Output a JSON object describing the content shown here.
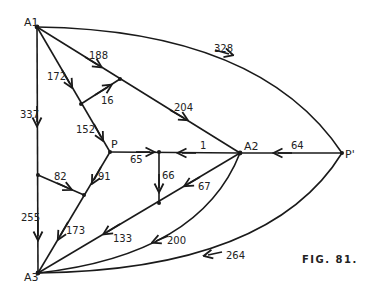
{
  "figure": {
    "caption": "FIG. 81.",
    "nodes": {
      "A1": {
        "label": "A1",
        "x": 37,
        "y": 27
      },
      "A2": {
        "label": "A2",
        "x": 240,
        "y": 153
      },
      "A3": {
        "label": "A3",
        "x": 38,
        "y": 273
      },
      "P": {
        "label": "P",
        "x": 110,
        "y": 152
      },
      "Pprime": {
        "label": "P'",
        "x": 342,
        "y": 153
      }
    },
    "edge_labels": {
      "e328": "328",
      "e188": "188",
      "e172": "172",
      "e16": "16",
      "e204": "204",
      "e337": "337",
      "e152": "152",
      "e65": "65",
      "e1": "1",
      "e64": "64",
      "e66": "66",
      "e67": "67",
      "e82": "82",
      "e91": "91",
      "e255": "255",
      "e173": "173",
      "e133": "133",
      "e200": "200",
      "e264": "264"
    }
  }
}
